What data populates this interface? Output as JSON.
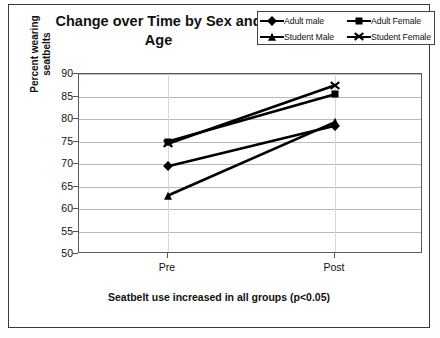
{
  "chart": {
    "title": "Change over Time by Sex and Age",
    "caption": "Seatbelt use increased in all groups (p<0.05)",
    "ylabel_line1": "Percent wearing",
    "ylabel_line2": "seatbelts"
  },
  "legend": {
    "entries": [
      {
        "label": "Adult male",
        "marker": "diamond"
      },
      {
        "label": "Adult Female",
        "marker": "square"
      },
      {
        "label": "Student Male",
        "marker": "triangle"
      },
      {
        "label": "Student Female",
        "marker": "x"
      }
    ]
  },
  "chart_data": {
    "type": "line",
    "title": "Change over Time by Sex and Age",
    "subtitle": "Seatbelt use increased in all groups (p<0.05)",
    "xlabel": "",
    "ylabel": "Percent wearing seatbelts",
    "categories": [
      "Pre",
      "Post"
    ],
    "ylim": [
      50,
      90
    ],
    "ytick_labels": [
      "50",
      "55",
      "60",
      "65",
      "70",
      "75",
      "80",
      "85",
      "90"
    ],
    "yticks": [
      50,
      55,
      60,
      65,
      70,
      75,
      80,
      85,
      90
    ],
    "grid": true,
    "legend_position": "top-right",
    "series": [
      {
        "name": "Adult male",
        "marker": "diamond",
        "values": [
          69.5,
          78.5
        ]
      },
      {
        "name": "Adult Female",
        "marker": "square",
        "values": [
          75.0,
          85.5
        ]
      },
      {
        "name": "Student Male",
        "marker": "triangle",
        "values": [
          63.0,
          79.3
        ]
      },
      {
        "name": "Student Female",
        "marker": "x",
        "values": [
          74.5,
          87.5
        ]
      }
    ],
    "colors": {
      "line": "#000000",
      "grid": "#b9b9b9",
      "axis": "#555555",
      "background": "#ffffff"
    }
  }
}
